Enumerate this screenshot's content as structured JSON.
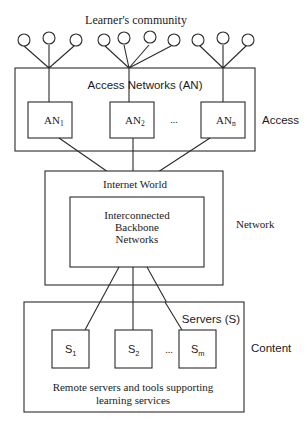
{
  "diagram": {
    "title": "Learner's community",
    "access_layer": {
      "group_label": "Access Networks (AN)",
      "side_label": "Access",
      "nodes": [
        {
          "label": "AN",
          "sub": "1"
        },
        {
          "label": "AN",
          "sub": "2"
        },
        {
          "label": "AN",
          "sub": "n"
        }
      ],
      "ellipsis": "..."
    },
    "network_layer": {
      "outer_label": "Internet World",
      "inner_label_lines": [
        "Interconnected",
        "Backbone",
        "Networks"
      ],
      "side_label": "Network"
    },
    "content_layer": {
      "group_label": "Servers (S)",
      "side_label": "Content",
      "nodes": [
        {
          "label": "S",
          "sub": "1"
        },
        {
          "label": "S",
          "sub": "2"
        },
        {
          "label": "S",
          "sub": "m"
        }
      ],
      "ellipsis": "...",
      "caption_lines": [
        "Remote servers and tools supporting",
        "learning services"
      ]
    },
    "learner_groups": [
      {
        "hub_x": 49,
        "circles_x": [
          24,
          49,
          76
        ]
      },
      {
        "hub_x": 129,
        "circles_x": [
          104,
          124,
          150,
          174
        ]
      },
      {
        "hub_x": 223,
        "circles_x": [
          198,
          223,
          248
        ]
      }
    ]
  }
}
